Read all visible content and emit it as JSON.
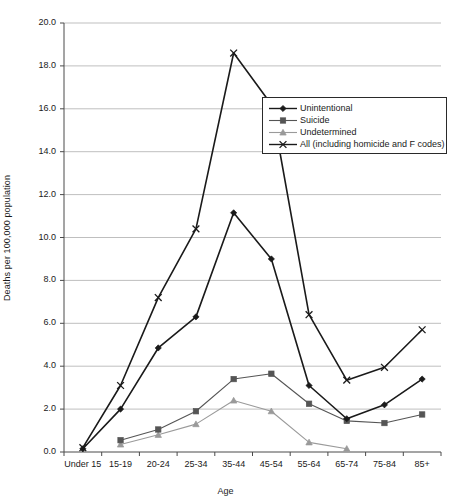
{
  "chart_data": {
    "type": "line",
    "title": "",
    "xlabel": "Age",
    "ylabel": "Deaths per 100,000 population",
    "categories": [
      "Under 15",
      "15-19",
      "20-24",
      "25-34",
      "35-44",
      "45-54",
      "55-64",
      "65-74",
      "75-84",
      "85+"
    ],
    "ylim": [
      0.0,
      20.0
    ],
    "ytick_step": 2.0,
    "ytick_labels": [
      "0.0",
      "2.0",
      "4.0",
      "6.0",
      "8.0",
      "10.0",
      "12.0",
      "14.0",
      "16.0",
      "18.0",
      "20.0"
    ],
    "grid": "horizontal",
    "legend_position": "upper-right-inside",
    "series": [
      {
        "name": "Unintentional",
        "marker": "diamond",
        "color": "#1a1a1a",
        "values": [
          0.15,
          2.0,
          4.85,
          6.3,
          11.15,
          9.0,
          3.1,
          1.55,
          2.2,
          3.4
        ]
      },
      {
        "name": "Suicide",
        "marker": "square",
        "color": "#555555",
        "values": [
          null,
          0.55,
          1.05,
          1.9,
          3.4,
          3.65,
          2.25,
          1.45,
          1.35,
          1.75
        ]
      },
      {
        "name": "Undetermined",
        "marker": "triangle",
        "color": "#9a9a9a",
        "values": [
          null,
          0.35,
          0.8,
          1.3,
          2.4,
          1.9,
          0.45,
          0.15,
          null,
          null
        ]
      },
      {
        "name": "All (including homicide and F codes)",
        "marker": "x",
        "color": "#1a1a1a",
        "values": [
          0.2,
          3.1,
          7.2,
          10.4,
          18.6,
          16.2,
          6.4,
          3.35,
          3.95,
          5.7
        ]
      }
    ]
  },
  "legend": {
    "items": [
      {
        "label": "Unintentional"
      },
      {
        "label": "Suicide"
      },
      {
        "label": "Undetermined"
      },
      {
        "label": "All (including homicide and F codes)"
      }
    ]
  },
  "layout": {
    "plot_left": 64,
    "plot_right": 441,
    "plot_top": 23,
    "plot_bottom": 452,
    "legend_x": 262,
    "legend_y": 97,
    "legend_w": 185,
    "legend_h": 57
  }
}
